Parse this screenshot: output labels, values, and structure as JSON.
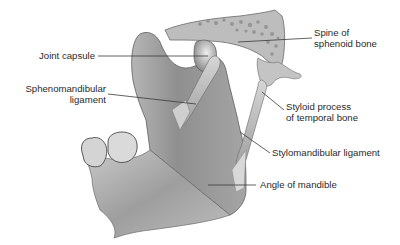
{
  "diagram": {
    "style": "grayscale anatomical illustration",
    "colors": {
      "background": "#ffffff",
      "label_text": "#2a2a2a",
      "leader_line": "#3a3a3a",
      "bone_light": "#d9d9d9",
      "bone_mid": "#a8a8a8",
      "bone_dark": "#6e6e6e"
    },
    "labels": [
      {
        "id": "joint-capsule",
        "lines": [
          "Joint capsule"
        ]
      },
      {
        "id": "sphenomandibular-ligament",
        "lines": [
          "Sphenomandibular",
          "ligament"
        ]
      },
      {
        "id": "spine-of-sphenoid-bone",
        "lines": [
          "Spine of",
          "sphenoid bone"
        ]
      },
      {
        "id": "styloid-process",
        "lines": [
          "Styloid process",
          "of temporal bone"
        ]
      },
      {
        "id": "stylomandibular-ligament",
        "lines": [
          "Stylomandibular ligament"
        ]
      },
      {
        "id": "angle-of-mandible",
        "lines": [
          "Angle of mandible"
        ]
      }
    ]
  }
}
